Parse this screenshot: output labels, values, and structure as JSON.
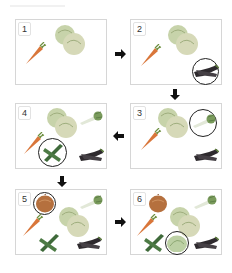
{
  "diagram": {
    "type": "step-sequence",
    "panels": [
      {
        "step": "1",
        "items": [
          "carrot",
          "cabbage"
        ],
        "highlighted": null
      },
      {
        "step": "2",
        "items": [
          "carrot",
          "cabbage",
          "eggplant"
        ],
        "highlighted": "eggplant"
      },
      {
        "step": "3",
        "items": [
          "carrot",
          "cabbage",
          "eggplant",
          "spring-onion"
        ],
        "highlighted": "spring-onion"
      },
      {
        "step": "4",
        "items": [
          "carrot",
          "cabbage",
          "eggplant",
          "spring-onion",
          "cucumbers"
        ],
        "highlighted": "cucumbers"
      },
      {
        "step": "5",
        "items": [
          "carrot",
          "cabbage",
          "eggplant",
          "spring-onion",
          "cucumbers",
          "onion"
        ],
        "highlighted": "onion"
      },
      {
        "step": "6",
        "items": [
          "carrot",
          "cabbage",
          "eggplant",
          "spring-onion",
          "cucumbers",
          "onion",
          "lettuce"
        ],
        "highlighted": "lettuce"
      }
    ],
    "arrows": [
      {
        "from": "1",
        "to": "2",
        "direction": "right"
      },
      {
        "from": "2",
        "to": "3",
        "direction": "down"
      },
      {
        "from": "3",
        "to": "4",
        "direction": "left"
      },
      {
        "from": "4",
        "to": "5",
        "direction": "down"
      },
      {
        "from": "5",
        "to": "6",
        "direction": "right"
      }
    ],
    "colors": {
      "panel_border": "#d6d6d6",
      "circle": "#222222",
      "arrow": "#111111",
      "carrot": "#d9763a",
      "cabbage": "#b9c89a",
      "eggplant": "#2e2a2e",
      "spring_onion": "#8fb070",
      "cucumber": "#3f6a3a",
      "onion": "#b5703e",
      "lettuce": "#bcd0a4"
    }
  },
  "labels": {
    "p1": "1",
    "p2": "2",
    "p3": "3",
    "p4": "4",
    "p5": "5",
    "p6": "6"
  }
}
